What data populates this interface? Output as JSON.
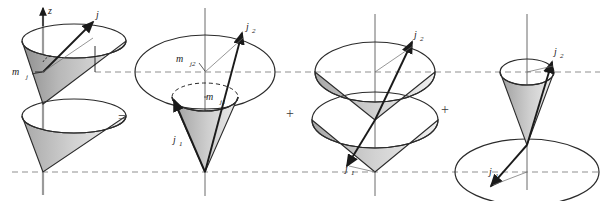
{
  "figure": {
    "kind": "vector-model-cone-diagram",
    "background": "#ffffff",
    "ink": "#2b2b2b",
    "cone_fill_light": "#e3e3e3",
    "cone_fill_dark": "#9a9a9a",
    "dashed_guide_color": "#8f8f8f"
  },
  "axis": {
    "z_label": "z"
  },
  "operators": {
    "equals": "=",
    "plus_1": "+",
    "plus_2": "+"
  },
  "panels": [
    {
      "id": "panel-total-j",
      "order": 1,
      "labels": {
        "vector_j": "j",
        "projection_mj": "m",
        "projection_mj_sub": "j"
      },
      "description": "Total angular momentum j precessing on a double cone about z, projection m_j"
    },
    {
      "id": "panel-coupled-j1-j2",
      "order": 2,
      "labels": {
        "vector_j2": "j",
        "vector_j2_sub": "2",
        "vector_j1": "j",
        "vector_j1_sub": "1",
        "projection_mj2": "m",
        "projection_mj2_sub": "j2",
        "projection_mj1": "m",
        "projection_mj1_sub": "j1"
      },
      "description": "j1 and j2 cones sharing a common apex, with separate projections m_j1 and m_j2"
    },
    {
      "id": "panel-double-cone-j1-j2",
      "order": 3,
      "labels": {
        "vector_j2": "j",
        "vector_j2_sub": "2",
        "vector_j1": "j",
        "vector_j1_sub": "1"
      },
      "description": "Upper cone carrying j2 above a lower inverted cone carrying j1"
    },
    {
      "id": "panel-small-cone-wide-disc",
      "order": 4,
      "labels": {
        "vector_j2": "j",
        "vector_j2_sub": "2",
        "vector_j1": "j",
        "vector_j1_sub": "1"
      },
      "description": "Narrow j2 cone above a wide flat j1 disc"
    }
  ],
  "guides": {
    "upper_dashed_y": 72,
    "lower_dashed_y": 172
  }
}
